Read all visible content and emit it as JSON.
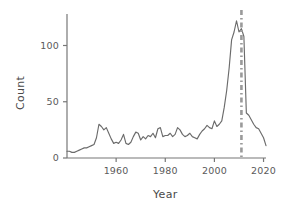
{
  "chart_data": {
    "type": "line",
    "title": "",
    "subtitle": "",
    "xlabel": "Year",
    "ylabel": "Count",
    "xlim": [
      1940,
      2021
    ],
    "ylim": [
      0,
      128
    ],
    "grid": false,
    "legend": null,
    "x_ticks": [
      "1960",
      "1980",
      "2000",
      "2020"
    ],
    "x_tick_values": [
      1960,
      1980,
      2000,
      2020
    ],
    "y_ticks": [
      "0",
      "50",
      "100"
    ],
    "y_tick_values": [
      0,
      50,
      100
    ],
    "line_color": "#6b6b6b",
    "annotation": {
      "type": "vertical-dash-dot-line",
      "label": "",
      "x_value": 2011,
      "color": "#9a9a9a"
    },
    "x": [
      1940,
      1941,
      1942,
      1943,
      1944,
      1945,
      1946,
      1947,
      1948,
      1949,
      1950,
      1951,
      1952,
      1953,
      1954,
      1955,
      1956,
      1957,
      1958,
      1959,
      1960,
      1961,
      1962,
      1963,
      1964,
      1965,
      1966,
      1967,
      1968,
      1969,
      1970,
      1971,
      1972,
      1973,
      1974,
      1975,
      1976,
      1977,
      1978,
      1979,
      1980,
      1981,
      1982,
      1983,
      1984,
      1985,
      1986,
      1987,
      1988,
      1989,
      1990,
      1991,
      1992,
      1993,
      1994,
      1995,
      1996,
      1997,
      1998,
      1999,
      2000,
      2001,
      2002,
      2003,
      2004,
      2005,
      2006,
      2007,
      2008,
      2009,
      2010,
      2011,
      2012,
      2013,
      2014,
      2015,
      2016,
      2017,
      2018,
      2019,
      2020,
      2021
    ],
    "y": [
      6,
      6,
      5,
      5,
      6,
      7,
      8,
      9,
      9,
      10,
      11,
      12,
      18,
      30,
      28,
      25,
      27,
      22,
      17,
      13,
      14,
      13,
      16,
      21,
      13,
      12,
      14,
      19,
      23,
      22,
      16,
      19,
      17,
      20,
      19,
      22,
      18,
      26,
      27,
      19,
      20,
      20,
      22,
      19,
      21,
      27,
      25,
      21,
      19,
      20,
      22,
      19,
      18,
      17,
      21,
      24,
      26,
      29,
      27,
      26,
      33,
      28,
      30,
      33,
      45,
      60,
      80,
      105,
      112,
      122,
      112,
      115,
      108,
      40,
      38,
      34,
      30,
      27,
      26,
      22,
      18,
      11
    ],
    "series": [
      {
        "name": "Count",
        "values": [
          6,
          6,
          5,
          5,
          6,
          7,
          8,
          9,
          9,
          10,
          11,
          12,
          18,
          30,
          28,
          25,
          27,
          22,
          17,
          13,
          14,
          13,
          16,
          21,
          13,
          12,
          14,
          19,
          23,
          22,
          16,
          19,
          17,
          20,
          19,
          22,
          18,
          26,
          27,
          19,
          20,
          20,
          22,
          19,
          21,
          27,
          25,
          21,
          19,
          20,
          22,
          19,
          18,
          17,
          21,
          24,
          26,
          29,
          27,
          26,
          33,
          28,
          30,
          33,
          45,
          60,
          80,
          105,
          112,
          122,
          112,
          115,
          108,
          40,
          38,
          34,
          30,
          27,
          26,
          22,
          18,
          11
        ]
      }
    ]
  }
}
